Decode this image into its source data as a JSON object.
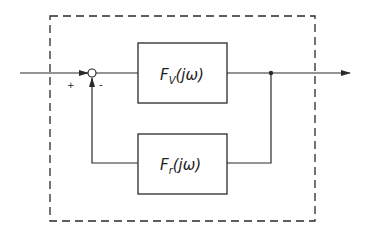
{
  "diagram": {
    "type": "feedback-control-block-diagram",
    "forward_block": {
      "main": "F",
      "sub": "V",
      "arg": "(jω)"
    },
    "feedback_block": {
      "main": "F",
      "sub": "r",
      "arg": "(jω)"
    },
    "summing_junction": {
      "plus_sign": "+",
      "minus_sign": "-"
    },
    "colors": {
      "line": "#2a2a2a",
      "background": "#ffffff"
    }
  }
}
